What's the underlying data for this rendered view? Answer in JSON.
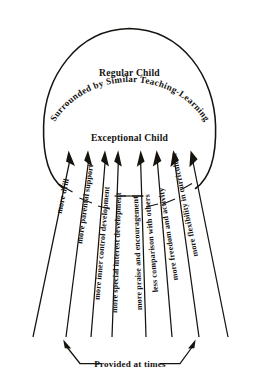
{
  "diagram": {
    "title_curved": "Surrounded by Similar Teaching-Learning",
    "outer_label": "Regular Child",
    "inner_label": "Exceptional Child",
    "bracket_label": "Provided at times",
    "ink_color": "#17140f",
    "background": "#ffffff"
  },
  "arrows": [
    {
      "label": "more drill"
    },
    {
      "label": "more parental support"
    },
    {
      "label": "more inner control development"
    },
    {
      "label": "more special interest development"
    },
    {
      "label": "more praise and encouragement"
    },
    {
      "label": "less comparison with others"
    },
    {
      "label": "more freedom and activity"
    },
    {
      "label": "more flexibility in curriculum"
    }
  ]
}
